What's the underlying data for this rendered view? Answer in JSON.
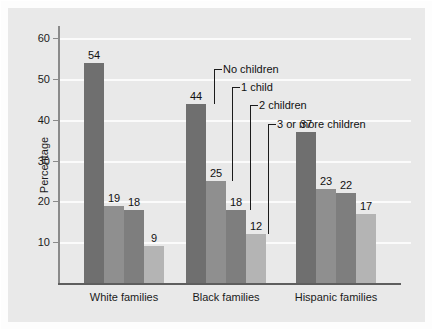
{
  "chart_data": {
    "type": "bar",
    "title": "",
    "xlabel": "",
    "ylabel": "Percentage",
    "ylim": [
      0,
      63
    ],
    "yticks": [
      10,
      20,
      30,
      40,
      50,
      60
    ],
    "ytick_labels": [
      "10",
      "20",
      "30",
      "40",
      "50",
      "60"
    ],
    "grid": true,
    "legend_position": "annotated-callouts",
    "categories": [
      "White families",
      "Black families",
      "Hispanic families"
    ],
    "series": [
      {
        "name": "No children",
        "values": [
          54,
          44,
          37
        ],
        "color": "#6f6f6f"
      },
      {
        "name": "1 child",
        "values": [
          19,
          25,
          23
        ],
        "color": "#8f8f8f"
      },
      {
        "name": "2 children",
        "values": [
          18,
          18,
          22
        ],
        "color": "#7e7e7e"
      },
      {
        "name": "3 or more children",
        "values": [
          9,
          12,
          17
        ],
        "color": "#b4b4b4"
      }
    ],
    "annotations": [
      {
        "label": "No children",
        "points_to": {
          "category": "Black families",
          "series": "No children",
          "value": 44
        }
      },
      {
        "label": "1 child",
        "points_to": {
          "category": "Black families",
          "series": "1 child",
          "value": 25
        }
      },
      {
        "label": "2 children",
        "points_to": {
          "category": "Black families",
          "series": "2 children",
          "value": 18
        }
      },
      {
        "label": "3 or more children",
        "points_to": {
          "category": "Black families",
          "series": "3 or more children",
          "value": 12
        }
      }
    ],
    "colors": {
      "background": "#e9e9e9",
      "gridline": "#fbfbfb",
      "axis": "#8a8a8a",
      "baseline": "#5e5e5e",
      "text": "#111111"
    }
  }
}
